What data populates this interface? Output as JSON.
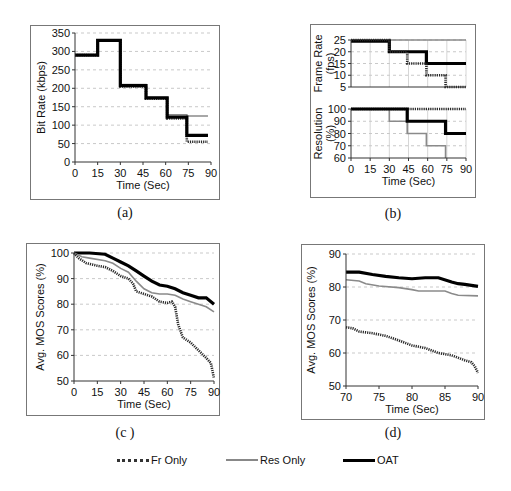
{
  "captions": {
    "a": "(a)",
    "b": "(b)",
    "c": "(c )",
    "d": "(d)"
  },
  "legend": [
    {
      "label": "Fr Only",
      "color": "#333333",
      "style": "dotted-thick"
    },
    {
      "label": "Res Only",
      "color": "#888888",
      "style": "thin"
    },
    {
      "label": "OAT",
      "color": "#000000",
      "style": "thick"
    }
  ],
  "chart_data": [
    {
      "id": "a",
      "type": "line",
      "step": true,
      "title": "",
      "xlabel": "Time (Sec)",
      "ylabel": "Bit Rate (kbps)",
      "xlim": [
        0,
        90
      ],
      "ylim": [
        0,
        350
      ],
      "xticks": [
        0,
        15,
        30,
        45,
        60,
        75,
        90
      ],
      "yticks": [
        0,
        50,
        100,
        150,
        200,
        250,
        300,
        350
      ],
      "grid": "horizontal-dashed",
      "series": [
        {
          "name": "Res Only",
          "x": [
            0,
            15,
            30,
            47,
            61,
            74,
            88
          ],
          "y": [
            290,
            330,
            210,
            175,
            128,
            125,
            125
          ]
        },
        {
          "name": "Fr Only",
          "x": [
            0,
            15,
            30,
            47,
            61,
            74,
            88
          ],
          "y": [
            290,
            330,
            205,
            172,
            118,
            55,
            55
          ]
        },
        {
          "name": "OAT",
          "x": [
            0,
            15,
            30,
            47,
            61,
            74,
            88
          ],
          "y": [
            290,
            330,
            207,
            174,
            122,
            72,
            72
          ]
        }
      ]
    },
    {
      "id": "b-top",
      "type": "line",
      "step": true,
      "xlabel": "",
      "ylabel": "Frame Rate (fps)",
      "xlim": [
        0,
        90
      ],
      "ylim": [
        5,
        25
      ],
      "xticks": [
        0,
        15,
        30,
        45,
        60,
        75,
        90
      ],
      "yticks": [
        5,
        10,
        15,
        20,
        25
      ],
      "grid": "both-dashed",
      "series": [
        {
          "name": "Res Only",
          "x": [
            0,
            90
          ],
          "y": [
            25,
            25
          ]
        },
        {
          "name": "OAT",
          "x": [
            0,
            30,
            59,
            90
          ],
          "y": [
            24.5,
            20,
            15,
            15
          ]
        },
        {
          "name": "Fr Only",
          "x": [
            0,
            30,
            44,
            59,
            74,
            90
          ],
          "y": [
            25,
            20,
            15,
            10,
            5,
            5
          ]
        }
      ]
    },
    {
      "id": "b-bottom",
      "type": "line",
      "step": true,
      "xlabel": "Time (Sec)",
      "ylabel": "Resolution (%)",
      "xlim": [
        0,
        90
      ],
      "ylim": [
        60,
        100
      ],
      "xticks": [
        0,
        15,
        30,
        45,
        60,
        75,
        90
      ],
      "yticks": [
        60,
        70,
        80,
        90,
        100
      ],
      "grid": "both-dashed",
      "series": [
        {
          "name": "Fr Only",
          "x": [
            0,
            90
          ],
          "y": [
            100,
            100
          ]
        },
        {
          "name": "Res Only",
          "x": [
            0,
            30,
            44,
            59,
            74,
            74
          ],
          "y": [
            100,
            90,
            80,
            70,
            60,
            60
          ]
        },
        {
          "name": "OAT",
          "x": [
            0,
            44,
            74,
            90
          ],
          "y": [
            100,
            90,
            80,
            80
          ]
        }
      ]
    },
    {
      "id": "c",
      "type": "line",
      "step": false,
      "xlabel": "Time (Sec)",
      "ylabel": "Avg. MOS Scores (%)",
      "xlim": [
        0,
        90
      ],
      "ylim": [
        50,
        100
      ],
      "xticks": [
        0,
        15,
        30,
        45,
        60,
        75,
        90
      ],
      "yticks": [
        50,
        60,
        70,
        80,
        90,
        100
      ],
      "grid": "horizontal-dashed",
      "series": [
        {
          "name": "OAT",
          "x": [
            0,
            10,
            20,
            25,
            30,
            35,
            40,
            45,
            50,
            55,
            60,
            65,
            70,
            75,
            80,
            85,
            90
          ],
          "y": [
            100,
            100,
            99.5,
            98,
            96.5,
            95,
            93,
            91,
            89,
            87.5,
            87,
            86,
            84.5,
            83.5,
            82.5,
            82.5,
            80
          ]
        },
        {
          "name": "Res Only",
          "x": [
            0,
            5,
            10,
            20,
            25,
            30,
            35,
            40,
            45,
            50,
            55,
            60,
            65,
            70,
            75,
            80,
            85,
            90
          ],
          "y": [
            100,
            98.5,
            98,
            97,
            96,
            94,
            92.5,
            89,
            86,
            84.5,
            84,
            84,
            83.5,
            82,
            81,
            80,
            79,
            77
          ]
        },
        {
          "name": "Fr Only",
          "x": [
            0,
            3,
            8,
            15,
            20,
            25,
            30,
            35,
            38,
            40,
            45,
            50,
            55,
            60,
            63,
            65,
            67,
            70,
            75,
            80,
            85,
            88,
            90
          ],
          "y": [
            100,
            98,
            96,
            95,
            94.5,
            93,
            91,
            90,
            88,
            85,
            84,
            83,
            81,
            80.5,
            81,
            79,
            72,
            67,
            65,
            62,
            59,
            57,
            51
          ]
        }
      ]
    },
    {
      "id": "d",
      "type": "line",
      "step": false,
      "xlabel": "Time (Sec)",
      "ylabel": "Avg. MOS Scores (%)",
      "xlim": [
        70,
        90
      ],
      "ylim": [
        50,
        90
      ],
      "xticks": [
        70,
        75,
        80,
        85,
        90
      ],
      "yticks": [
        50,
        60,
        70,
        80,
        90
      ],
      "grid": "horizontal-dashed",
      "series": [
        {
          "name": "OAT",
          "x": [
            70,
            72,
            74,
            76,
            78,
            80,
            82,
            84,
            86,
            87,
            88,
            89,
            90
          ],
          "y": [
            84.5,
            84.5,
            83.8,
            83.2,
            82.8,
            82.5,
            82.8,
            82.8,
            81.5,
            81,
            80.8,
            80.5,
            80.2
          ]
        },
        {
          "name": "Res Only",
          "x": [
            70,
            72,
            73,
            75,
            78,
            80,
            81,
            85,
            86,
            87,
            90
          ],
          "y": [
            82.2,
            81.8,
            81,
            80.3,
            79.8,
            79.2,
            78.8,
            78.8,
            78,
            77.5,
            77.3
          ]
        },
        {
          "name": "Fr Only",
          "x": [
            70,
            71,
            72,
            74,
            76,
            78,
            80,
            82,
            84,
            86,
            88,
            89,
            89.5,
            90
          ],
          "y": [
            67.8,
            67.5,
            66.5,
            66,
            65.2,
            63.8,
            62.3,
            61.5,
            60,
            59.3,
            57.8,
            57.2,
            56,
            54
          ]
        }
      ]
    }
  ],
  "styles": {
    "OAT": {
      "color": "#000000",
      "width": 3.2,
      "dash": ""
    },
    "Res Only": {
      "color": "#8a8a8a",
      "width": 1.6,
      "dash": ""
    },
    "Fr Only": {
      "color": "#2a2a2a",
      "width": 2.6,
      "dash": "1.2,1"
    }
  },
  "layout": {
    "a": {
      "frame": [
        30,
        25,
        190,
        175
      ],
      "plot": [
        75,
        33,
        211,
        162
      ]
    },
    "b-frame": [
      310,
      24,
      166,
      174
    ],
    "b-top": {
      "plot": [
        351,
        40,
        466,
        87
      ]
    },
    "b-bottom": {
      "plot": [
        351,
        109,
        466,
        158
      ]
    },
    "c": {
      "frame": [
        26,
        243,
        194,
        173
      ],
      "plot": [
        74,
        253,
        214,
        381
      ]
    },
    "d": {
      "frame": [
        301,
        244,
        184,
        176
      ],
      "plot": [
        346,
        254,
        478,
        386
      ]
    }
  }
}
